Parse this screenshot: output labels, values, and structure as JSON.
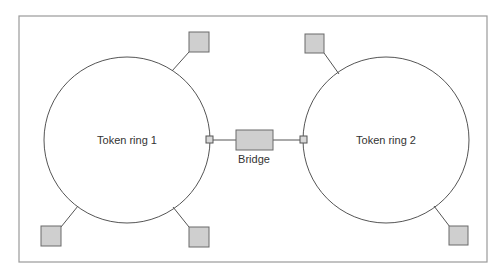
{
  "diagram": {
    "type": "network-topology",
    "rings": [
      {
        "id": "ring1",
        "label": "Token ring 1",
        "stations": 3
      },
      {
        "id": "ring2",
        "label": "Token ring 2",
        "stations": 2
      }
    ],
    "bridge": {
      "label": "Bridge",
      "connects": [
        "ring1",
        "ring2"
      ]
    },
    "colors": {
      "station_fill": "#cfcfcf",
      "line": "#555555",
      "frame": "#9a9a9a"
    }
  }
}
